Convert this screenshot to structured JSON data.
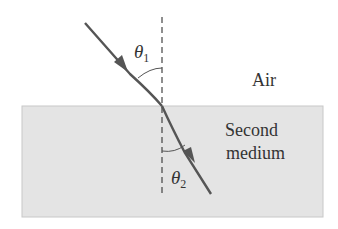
{
  "diagram": {
    "type": "refraction",
    "labels": {
      "upper_medium": "Air",
      "lower_medium_line1": "Second",
      "lower_medium_line2": "medium",
      "incident_angle": "θ",
      "incident_angle_sub": "1",
      "refracted_angle": "θ",
      "refracted_angle_sub": "2"
    },
    "colors": {
      "medium_fill": "#e4e4e4",
      "medium_border": "#c8c8c8",
      "ray": "#555555",
      "normal_line": "#444444",
      "text": "#333333"
    }
  }
}
